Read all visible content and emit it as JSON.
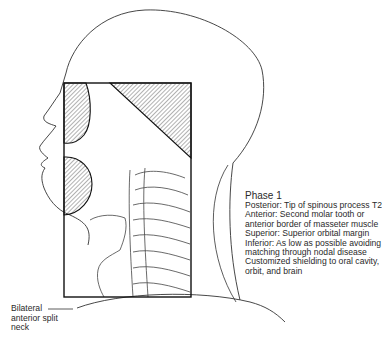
{
  "figure": {
    "caption": {
      "title": "Phase 1",
      "lines": [
        "Posterior: Tip of spinous process T2",
        "Anterior: Second molar tooth or",
        "anterior border of masseter muscle",
        "Superior: Superior orbital margin",
        "Inferior: As low as possible avoiding",
        "matching through nodal disease",
        "Customized shielding to oral cavity,",
        "orbit, and brain"
      ]
    },
    "pointer_label": {
      "lines": [
        "Bilateral",
        "anterior split",
        "neck"
      ]
    },
    "colors": {
      "line": "#222222",
      "hatch": "#555555",
      "background": "#ffffff"
    }
  }
}
